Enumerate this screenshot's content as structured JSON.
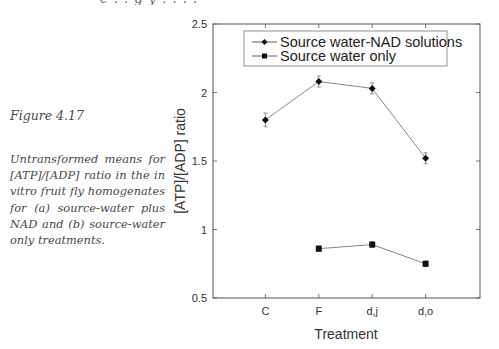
{
  "page": {
    "top_clipped_text": "e .   .    g                                y  .  .  .  ."
  },
  "caption": {
    "title": "Figure 4.17",
    "body": "Untransformed means for [ATP]/[ADP] ratio in the in vitro fruit fly homogenates for (a) source-water plus NAD and (b) source-water only treatments."
  },
  "colors": {
    "axis": "#555555",
    "line": "#888888",
    "marker": "#111111",
    "error_bar": "#777777"
  },
  "chart_data": {
    "type": "line",
    "title": "",
    "xlabel": "Treatment",
    "ylabel": "[ATP]/[ADP] ratio",
    "categories": [
      "C",
      "F",
      "d,j",
      "d,o"
    ],
    "ylim": [
      0.5,
      2.5
    ],
    "yticks": [
      0.5,
      1,
      1.5,
      2,
      2.5
    ],
    "ytick_labels": [
      "0.5",
      "1",
      "1.5",
      "2",
      "2.5"
    ],
    "grid": false,
    "legend_position": "upper center (inside)",
    "series": [
      {
        "name": "Source water-NAD solutions",
        "marker": "diamond",
        "values": [
          1.8,
          2.08,
          2.03,
          1.52
        ],
        "errors": [
          0.05,
          0.04,
          0.04,
          0.04
        ]
      },
      {
        "name": "Source water only",
        "marker": "square",
        "values": [
          null,
          0.86,
          0.89,
          0.75
        ],
        "errors": [
          null,
          0.02,
          0.02,
          0.02
        ]
      }
    ]
  }
}
